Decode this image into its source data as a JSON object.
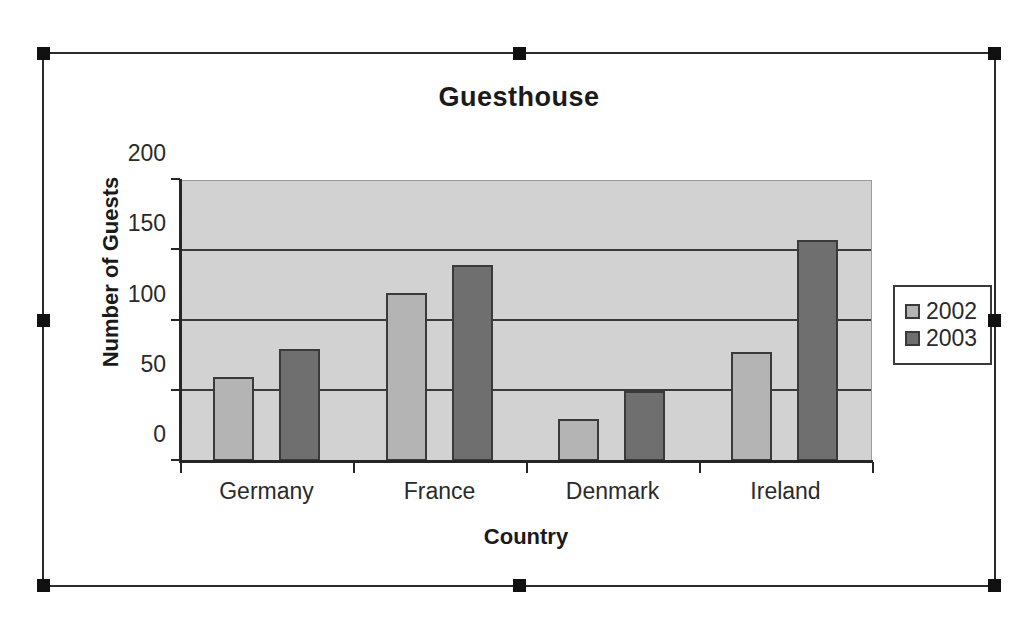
{
  "chart_data": {
    "type": "bar",
    "title": "Guesthouse",
    "xlabel": "Country",
    "ylabel": "Number of Guests",
    "categories": [
      "Germany",
      "France",
      "Denmark",
      "Ireland"
    ],
    "series": [
      {
        "name": "2002",
        "color": "#b4b4b4",
        "values": [
          60,
          120,
          30,
          78
        ]
      },
      {
        "name": "2003",
        "color": "#6f6f6f",
        "values": [
          80,
          140,
          50,
          158
        ]
      }
    ],
    "ylim": [
      0,
      200
    ],
    "yticks": [
      0,
      50,
      100,
      150,
      200
    ],
    "ytick_labels": [
      "0",
      "50",
      "100",
      "150",
      "200"
    ],
    "grid": true,
    "legend_position": "right",
    "plot_background": "#d2d2d2",
    "axis_color": "#262626"
  },
  "selection": {
    "frame_label": "chart-object-selection-frame",
    "handle_color": "#111111",
    "handle_count": 8
  }
}
